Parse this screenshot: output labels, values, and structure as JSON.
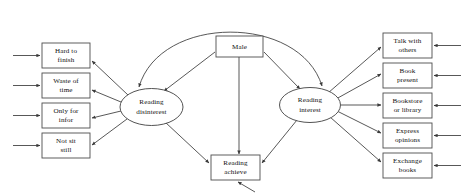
{
  "diagram": {
    "type": "path-diagram",
    "canvas": {
      "width": 466,
      "height": 195,
      "background": "#ffffff"
    },
    "style": {
      "stroke_color": "#3a3a3a",
      "box_stroke": "#4d4d4d",
      "text_color": "#111111",
      "fill": "#ffffff"
    },
    "latent_variables": [
      {
        "id": "reading-disinterest",
        "line1": "Reading",
        "line2": "disinterest",
        "shape": "ellipse",
        "cx": 151.5,
        "cy": 107,
        "rx": 31.5,
        "ry": 18.5
      },
      {
        "id": "reading-interest",
        "line1": "Reading",
        "line2": "interest",
        "shape": "ellipse",
        "cx": 310,
        "cy": 105,
        "rx": 30.5,
        "ry": 17.5
      }
    ],
    "observed_left": [
      {
        "id": "hard-to-finish",
        "line1": "Hard to",
        "line2": "finish",
        "x": 42,
        "y": 43,
        "w": 48,
        "h": 25
      },
      {
        "id": "waste-of-time",
        "line1": "Waste of",
        "line2": "time",
        "x": 42,
        "y": 73,
        "w": 48,
        "h": 25
      },
      {
        "id": "only-for-infor",
        "line1": "Only for",
        "line2": "infor",
        "x": 42,
        "y": 103,
        "w": 48,
        "h": 25
      },
      {
        "id": "not-sit-still",
        "line1": "Not sit",
        "line2": "still",
        "x": 42,
        "y": 133,
        "w": 48,
        "h": 25
      }
    ],
    "observed_right": [
      {
        "id": "talk-with-others",
        "line1": "Talk with",
        "line2": "others",
        "x": 383,
        "y": 33,
        "w": 49,
        "h": 25
      },
      {
        "id": "book-present",
        "line1": "Book",
        "line2": "present",
        "x": 383,
        "y": 63,
        "w": 49,
        "h": 25
      },
      {
        "id": "bookstore-or-library",
        "line1": "Bookstore",
        "line2": "or library",
        "x": 383,
        "y": 93,
        "w": 49,
        "h": 25
      },
      {
        "id": "express-opinions",
        "line1": "Express",
        "line2": "opinions",
        "x": 383,
        "y": 123,
        "w": 49,
        "h": 25
      },
      {
        "id": "exchange-books",
        "line1": "Exchange",
        "line2": "books",
        "x": 383,
        "y": 153,
        "w": 49,
        "h": 25
      }
    ],
    "observed_center": [
      {
        "id": "male",
        "line1": "Male",
        "line2": "",
        "x": 216,
        "y": 36,
        "w": 47,
        "h": 21
      },
      {
        "id": "reading-achieve",
        "line1": "Reading",
        "line2": "achieve",
        "x": 211,
        "y": 155,
        "w": 49,
        "h": 25
      }
    ],
    "paths": [
      {
        "from": "reading-disinterest",
        "to": "hard-to-finish"
      },
      {
        "from": "reading-disinterest",
        "to": "waste-of-time"
      },
      {
        "from": "reading-disinterest",
        "to": "only-for-infor"
      },
      {
        "from": "reading-disinterest",
        "to": "not-sit-still"
      },
      {
        "from": "reading-interest",
        "to": "talk-with-others"
      },
      {
        "from": "reading-interest",
        "to": "book-present"
      },
      {
        "from": "reading-interest",
        "to": "bookstore-or-library"
      },
      {
        "from": "reading-interest",
        "to": "express-opinions"
      },
      {
        "from": "reading-interest",
        "to": "exchange-books"
      },
      {
        "from": "male",
        "to": "reading-disinterest"
      },
      {
        "from": "male",
        "to": "reading-interest"
      },
      {
        "from": "male",
        "to": "reading-achieve"
      },
      {
        "from": "reading-disinterest",
        "to": "reading-achieve"
      },
      {
        "from": "reading-interest",
        "to": "reading-achieve"
      },
      {
        "from": "reading-disinterest",
        "to": "reading-interest",
        "style": "curved-double-headed"
      }
    ],
    "error_terms": {
      "left_count": 4,
      "right_count": 5,
      "achieve_count": 1
    }
  }
}
